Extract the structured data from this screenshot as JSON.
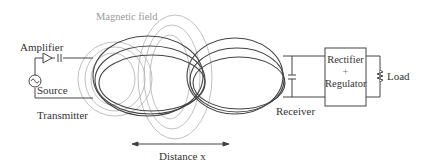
{
  "diagram": {
    "labels": {
      "magnetic_field": "Magnetic field",
      "amplifier": "Amplifier",
      "source": "Source",
      "transmitter": "Transmitter",
      "receiver": "Receiver",
      "rectifier": "Rectifier",
      "plus": "+",
      "regulator": "Regulator",
      "load": "Load",
      "distance": "Distance x"
    },
    "components": [
      {
        "id": "source",
        "icon": "ac-source-icon"
      },
      {
        "id": "amplifier",
        "icon": "triangle-amplifier-icon"
      },
      {
        "id": "capacitor-tx",
        "icon": "capacitor-icon"
      },
      {
        "id": "transmitter-coil",
        "icon": "coil-icon"
      },
      {
        "id": "receiver-coil",
        "icon": "coil-icon"
      },
      {
        "id": "capacitor-rx",
        "icon": "capacitor-icon"
      },
      {
        "id": "rectifier-regulator",
        "icon": "block-box"
      },
      {
        "id": "load",
        "icon": "resistor-icon"
      }
    ],
    "colors": {
      "line": "#444444",
      "field": "#aaaaaa",
      "text": "#333333",
      "field_label": "#9a9a9a"
    }
  }
}
